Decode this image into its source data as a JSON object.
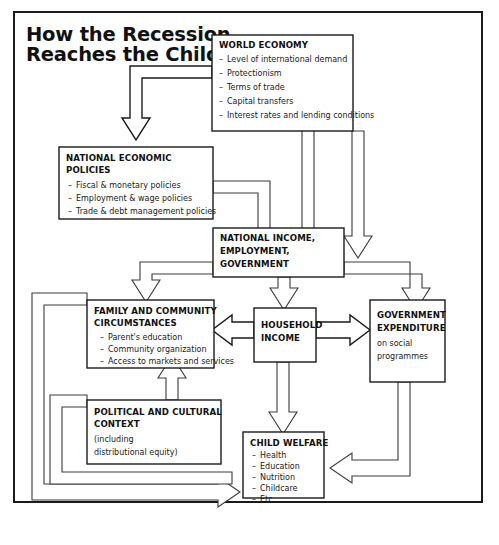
{
  "title": {
    "line1": "How the Recession",
    "line2": "Reaches the Child"
  },
  "boxes": {
    "world_economy": {
      "heading": "WORLD ECONOMY",
      "items": [
        "Level of international demand",
        "Protectionism",
        "Terms of trade",
        "Capital transfers",
        "Interest rates and lending conditions"
      ]
    },
    "national_policies": {
      "heading_line1": "NATIONAL ECONOMIC",
      "heading_line2": "POLICIES",
      "items": [
        "Fiscal & monetary policies",
        "Employment & wage policies",
        "Trade & debt management policies"
      ]
    },
    "national_income": {
      "heading_line1": "NATIONAL INCOME,",
      "heading_line2": "EMPLOYMENT,",
      "heading_line3": "GOVERNMENT"
    },
    "family_community": {
      "heading_line1": "FAMILY AND COMMUNITY",
      "heading_line2": "CIRCUMSTANCES",
      "items": [
        "Parent's education",
        "Community organization",
        "Access to markets and services"
      ]
    },
    "household_income": {
      "heading_line1": "HOUSEHOLD",
      "heading_line2": "INCOME"
    },
    "government_expenditure": {
      "heading_line1": "GOVERNMENT",
      "heading_line2": "EXPENDITURE",
      "sub_line1": "on social",
      "sub_line2": "programmes"
    },
    "political_cultural": {
      "heading_line1": "POLITICAL AND CULTURAL",
      "heading_line2": "CONTEXT",
      "sub_line1": "(including",
      "sub_line2": "distributional equity)"
    },
    "child_welfare": {
      "heading": "CHILD WELFARE",
      "items": [
        "Health",
        "Education",
        "Nutrition",
        "Childcare",
        "Etc."
      ]
    }
  },
  "colors": {
    "ink": "#1a1a1a",
    "connector": "#3a3a3a",
    "paper": "#ffffff"
  }
}
